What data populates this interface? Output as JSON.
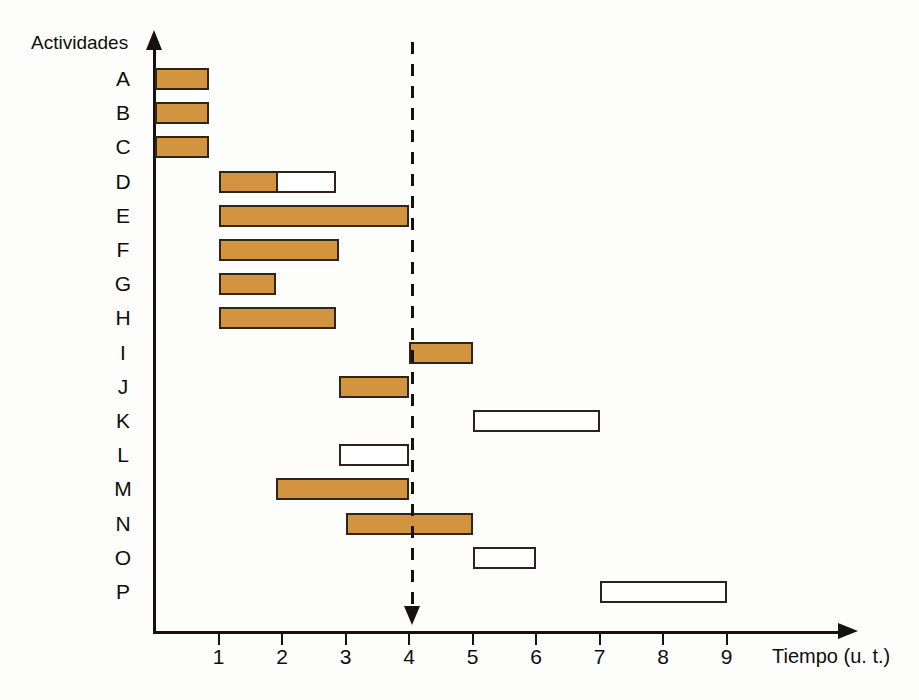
{
  "axes": {
    "y_title": "Actividades",
    "x_title": "Tiempo (u. t.)",
    "x_ticks": [
      "1",
      "2",
      "3",
      "4",
      "5",
      "6",
      "7",
      "8",
      "9"
    ]
  },
  "colors": {
    "bar_fill": "#d2943f",
    "bar_stroke": "#2a241d",
    "bar_empty": "#ffffff",
    "axis": "#15120f",
    "background": "#fdfdfc"
  },
  "chart_data": {
    "type": "bar",
    "title": "",
    "xlabel": "Tiempo (u. t.)",
    "ylabel": "Actividades",
    "xlim": [
      0,
      9.8
    ],
    "grid": false,
    "legend": "none",
    "orientation": "horizontal",
    "annotations": [
      {
        "name": "deadline-marker",
        "type": "vertical-dashed-arrow",
        "x": 4
      }
    ],
    "categories": [
      "A",
      "B",
      "C",
      "D",
      "E",
      "F",
      "G",
      "H",
      "I",
      "J",
      "K",
      "L",
      "M",
      "N",
      "O",
      "P"
    ],
    "bars": [
      {
        "label": "A",
        "start": 0,
        "end": 0.85,
        "fill": "solid",
        "progress_end": 0.85
      },
      {
        "label": "B",
        "start": 0,
        "end": 0.85,
        "fill": "solid",
        "progress_end": 0.85
      },
      {
        "label": "C",
        "start": 0,
        "end": 0.85,
        "fill": "solid",
        "progress_end": 0.85
      },
      {
        "label": "D",
        "start": 1.0,
        "end": 2.85,
        "fill": "partial",
        "progress_end": 1.9
      },
      {
        "label": "E",
        "start": 1.0,
        "end": 4.0,
        "fill": "solid",
        "progress_end": 4.0
      },
      {
        "label": "F",
        "start": 1.0,
        "end": 2.9,
        "fill": "solid",
        "progress_end": 2.9
      },
      {
        "label": "G",
        "start": 1.0,
        "end": 1.9,
        "fill": "solid",
        "progress_end": 1.9
      },
      {
        "label": "H",
        "start": 1.0,
        "end": 2.85,
        "fill": "solid",
        "progress_end": 2.85
      },
      {
        "label": "I",
        "start": 4.0,
        "end": 5.0,
        "fill": "solid",
        "progress_end": 5.0
      },
      {
        "label": "J",
        "start": 2.9,
        "end": 4.0,
        "fill": "solid",
        "progress_end": 4.0
      },
      {
        "label": "K",
        "start": 5.0,
        "end": 7.0,
        "fill": "empty",
        "progress_end": 5.0
      },
      {
        "label": "L",
        "start": 2.9,
        "end": 4.0,
        "fill": "empty",
        "progress_end": 2.9
      },
      {
        "label": "M",
        "start": 1.9,
        "end": 4.0,
        "fill": "solid",
        "progress_end": 4.0
      },
      {
        "label": "N",
        "start": 3.0,
        "end": 5.0,
        "fill": "solid",
        "progress_end": 5.0
      },
      {
        "label": "O",
        "start": 5.0,
        "end": 6.0,
        "fill": "empty",
        "progress_end": 5.0
      },
      {
        "label": "P",
        "start": 7.0,
        "end": 9.0,
        "fill": "empty",
        "progress_end": 7.0
      }
    ]
  }
}
